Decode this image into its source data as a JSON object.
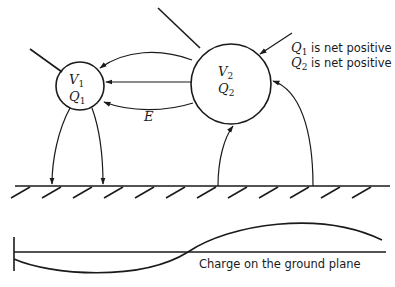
{
  "diagram": {
    "conductor_1": {
      "voltage_symbol": "V",
      "voltage_sub": "1",
      "charge_symbol": "Q",
      "charge_sub": "1"
    },
    "conductor_2": {
      "voltage_symbol": "V",
      "voltage_sub": "2",
      "charge_symbol": "Q",
      "charge_sub": "2"
    },
    "field_label": "E",
    "notes": [
      {
        "symbol": "Q",
        "sub": "1",
        "text": " is net positive"
      },
      {
        "symbol": "Q",
        "sub": "2",
        "text": " is net positive"
      }
    ],
    "ground_caption": "Charge on the ground plane"
  }
}
